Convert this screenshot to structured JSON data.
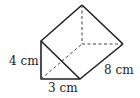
{
  "figure": {
    "type": "triangular-prism",
    "labels": {
      "height": "4 cm",
      "base": "3 cm",
      "length": "8 cm"
    },
    "colors": {
      "stroke": "#222222",
      "background": "#ffffff"
    }
  }
}
